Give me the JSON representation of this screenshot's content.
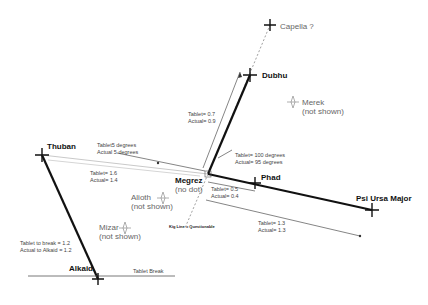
{
  "stars": {
    "capella": {
      "label": "Capella ?"
    },
    "dubhu": {
      "label": "Dubhu"
    },
    "merek": {
      "label": "Merek",
      "note": "(not shown)"
    },
    "thuban": {
      "label": "Thuban"
    },
    "megrez": {
      "label": "Megrez",
      "note": "(no dot)"
    },
    "phad": {
      "label": "Phad"
    },
    "psi_ursa_major": {
      "label": "Psi Ursa Major"
    },
    "alioth": {
      "label": "Alioth",
      "note": "(not shown)"
    },
    "mizar": {
      "label": "Mizar",
      "note": "(not shown)"
    },
    "alkaid": {
      "label": "Alkaid"
    }
  },
  "measurements": {
    "megrez_dubhu": {
      "tablet": "Tablet= 0.7",
      "actual": "Actual= 0.9"
    },
    "thuban_angle": {
      "tablet": "Tablet5 degrees",
      "actual": "Actual 5 degrees"
    },
    "thuban_dist": {
      "tablet": "Tablet= 1.6",
      "actual": "Actual= 1.4"
    },
    "dubhu_angle": {
      "tablet": "Tablet= 100 degrees",
      "actual": "Actual= 95 degrees"
    },
    "megrez_phad": {
      "tablet": "Tablet= 0.5",
      "actual": "Actual= 0.4"
    },
    "megrez_psi": {
      "tablet": "Tablet= 1.3",
      "actual": "Actual= 1.3"
    },
    "alkaid": {
      "tablet": "Tablet to break = 1.2",
      "actual": "Actual to Alkaid = 1.2"
    }
  },
  "annotations": {
    "kig_line": "Kig Line = Questionable",
    "tablet_break": "Tablet Break"
  },
  "colors": {
    "main_line": "#111111",
    "thin_line": "#333333",
    "dashed_line": "#888888",
    "faint_star": "#999999"
  }
}
